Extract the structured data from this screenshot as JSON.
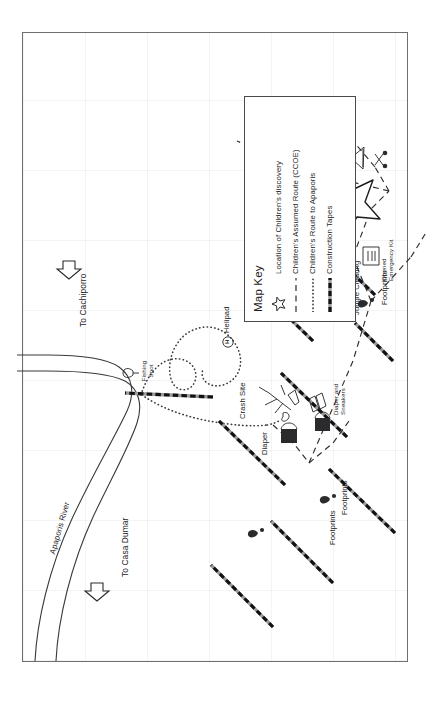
{
  "document": {
    "title_line1": "Search Area & Evidence",
    "title_line2": "of Children's Survival",
    "orientation": "landscape-map-rotated-in-portrait-page",
    "background_color": "#ffffff",
    "frame_color": "#6f6f72"
  },
  "scale": {
    "label": "Kilometer",
    "segments": 2
  },
  "compass": {
    "north": "N",
    "south": "S",
    "east": "E",
    "west": "W"
  },
  "map_key": {
    "title": "Map Key",
    "items": [
      {
        "glyph": "star-outline",
        "label": "Location of Children's discovery"
      },
      {
        "glyph": "dashed-line",
        "label": "Children's Assumed Route (CCOE)"
      },
      {
        "glyph": "dotted-line",
        "label": "Children's Route to Apaporis"
      },
      {
        "glyph": "hatched-tape-line",
        "label": "Construction Tapes"
      }
    ]
  },
  "map_labels": {
    "river": "Apaporis River",
    "direction_casa_dumar": "To Casa Dumar",
    "direction_cachiporro": "To Cachiporro",
    "fishing_spot": "Fishing\nSpot",
    "crash_site": "Crash Site",
    "helipad": "Helipad",
    "helipad_symbol": "H",
    "diaper": "Diaper",
    "diaper_and_sneakers": "Diaper and\nSneakers",
    "footprints_north": "Footprints",
    "footprints_mid": "Footprints",
    "footprints_south": "Footprints",
    "shelter_and_scissors": "Shelter and\nScissors",
    "bottle": "Bottle",
    "maracuya_and_footprints": "Maracuya and\nFootprints",
    "shelter": "Shelter",
    "opened_emergency_kit": "Opened\nEmergency Kit",
    "jungle_clearing": "Jungle Clearing"
  },
  "features": {
    "construction_tape_count": 9,
    "star_marker_count": 1,
    "route_types": [
      "dashed",
      "dotted"
    ]
  }
}
